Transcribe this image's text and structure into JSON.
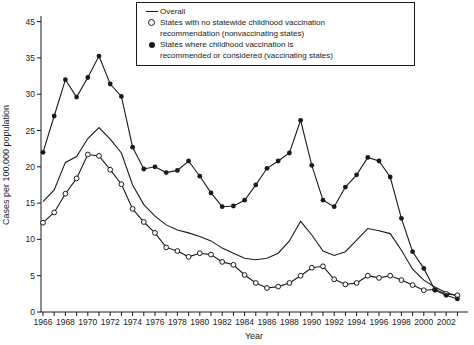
{
  "figure": {
    "y_axis_title": "Cases per 100,000 population",
    "x_axis_title": "Year"
  },
  "legend": {
    "items": [
      {
        "marker": "line-symbol",
        "lines": [
          "Overall"
        ]
      },
      {
        "marker": "open-circle-symbol",
        "lines": [
          "States with no statewide childhood vaccination",
          "recommendation (nonvaccinating states)"
        ]
      },
      {
        "marker": "filled-circle-symbol",
        "lines": [
          "States where childhood vaccination is",
          "recommended or considered (vaccinating states)"
        ]
      }
    ]
  },
  "chart_data": {
    "type": "line",
    "title": "",
    "xlabel": "Year",
    "ylabel": "Cases per 100,000 population",
    "x": [
      1966,
      1967,
      1968,
      1969,
      1970,
      1971,
      1972,
      1973,
      1974,
      1975,
      1976,
      1977,
      1978,
      1979,
      1980,
      1981,
      1982,
      1983,
      1984,
      1985,
      1986,
      1987,
      1988,
      1989,
      1990,
      1991,
      1992,
      1993,
      1994,
      1995,
      1996,
      1997,
      1998,
      1999,
      2000,
      2001,
      2002,
      2003
    ],
    "x_tick_labels": [
      "1966",
      "1968",
      "1970",
      "1972",
      "1974",
      "1976",
      "1978",
      "1980",
      "1982",
      "1984",
      "1986",
      "1988",
      "1990",
      "1992",
      "1994",
      "1996",
      "1998",
      "2000",
      "2002"
    ],
    "y_tick_labels": [
      "0",
      "5",
      "10",
      "15",
      "20",
      "25",
      "30",
      "35",
      "45"
    ],
    "ylim": [
      0,
      45
    ],
    "grid": false,
    "legend_position": "top",
    "line_color": "#1a1a1a",
    "series": [
      {
        "name": "Overall",
        "marker": "none",
        "values": [
          15.2,
          16.8,
          20.6,
          21.4,
          23.9,
          25.4,
          23.8,
          21.9,
          17.5,
          14.8,
          13.2,
          12.0,
          11.3,
          10.9,
          10.4,
          9.8,
          8.8,
          8.1,
          7.4,
          7.2,
          7.4,
          8.1,
          9.8,
          12.5,
          10.6,
          8.4,
          7.8,
          8.3,
          9.9,
          11.5,
          11.2,
          10.8,
          8.5,
          5.9,
          4.4,
          3.4,
          2.7,
          2.2
        ]
      },
      {
        "name": "States with no statewide childhood vaccination recommendation (nonvaccinating states)",
        "marker": "open-circle",
        "values": [
          12.3,
          13.7,
          16.3,
          18.4,
          21.7,
          21.5,
          19.6,
          17.6,
          14.2,
          12.4,
          10.9,
          8.9,
          8.4,
          7.6,
          8.1,
          7.9,
          6.9,
          6.5,
          5.1,
          4.0,
          3.3,
          3.5,
          4.0,
          5.0,
          6.1,
          6.3,
          4.5,
          3.8,
          4.0,
          5.0,
          4.7,
          5.0,
          4.4,
          3.7,
          3.0,
          3.1,
          2.5,
          2.3
        ]
      },
      {
        "name": "States where childhood vaccination is recommended or considered (vaccinating states)",
        "marker": "filled-circle",
        "values": [
          22.0,
          27.0,
          32.0,
          29.6,
          32.3,
          35.5,
          31.4,
          29.7,
          22.7,
          19.7,
          20.0,
          19.2,
          19.5,
          20.8,
          18.7,
          16.4,
          14.5,
          14.6,
          15.4,
          17.5,
          19.8,
          20.8,
          21.9,
          26.4,
          20.2,
          15.4,
          14.5,
          17.2,
          18.9,
          21.3,
          20.8,
          18.6,
          12.9,
          8.3,
          6.0,
          3.0,
          2.3,
          1.8
        ]
      }
    ]
  }
}
